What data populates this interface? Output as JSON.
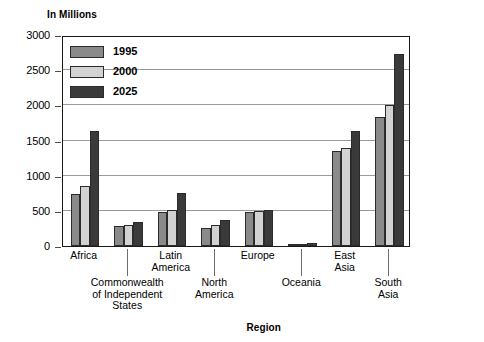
{
  "chart": {
    "type": "bar",
    "y_axis_title": "In Millions",
    "x_axis_title": "Region"
  },
  "chart_data": {
    "type": "bar",
    "title": "",
    "subtitle": "",
    "xlabel": "Region",
    "ylabel": "In Millions",
    "ylim": [
      0,
      3000
    ],
    "yticks": [
      0,
      500,
      1000,
      1500,
      2000,
      2500,
      3000
    ],
    "ytick_labels": [
      "0",
      "500",
      "1000",
      "1500",
      "2000",
      "2500",
      "3000"
    ],
    "grid": true,
    "legend_position": "upper-left-inside",
    "categories": [
      "Africa",
      "Commonwealth\nof Independent\nStates",
      "Latin\nAmerica",
      "North\nAmerica",
      "Europe",
      "Oceania",
      "East\nAsia",
      "South\nAsia"
    ],
    "series": [
      {
        "name": "1995",
        "color": "#8a8a8a",
        "values": [
          740,
          290,
          480,
          255,
          490,
          25,
          1350,
          1840
        ]
      },
      {
        "name": "2000",
        "color": "#d2d2d2",
        "values": [
          860,
          300,
          510,
          300,
          500,
          30,
          1400,
          2000
        ]
      },
      {
        "name": "2025",
        "color": "#3a3a3a",
        "values": [
          1640,
          340,
          760,
          370,
          510,
          40,
          1640,
          2730
        ]
      }
    ]
  },
  "legend": {
    "items": [
      {
        "label": "1995",
        "color": "#8a8a8a"
      },
      {
        "label": "2000",
        "color": "#d2d2d2"
      },
      {
        "label": "2025",
        "color": "#3a3a3a"
      }
    ]
  }
}
